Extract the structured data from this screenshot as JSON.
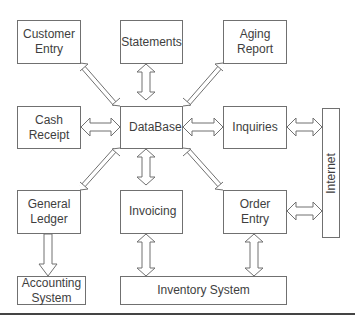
{
  "diagram": {
    "nodes": {
      "customer_entry": "Customer\nEntry",
      "statements": "Statements",
      "aging_report": "Aging\nReport",
      "cash_receipt": "Cash\nReceipt",
      "database": "DataBase",
      "inquiries": "Inquiries",
      "internet": "Internet",
      "general_ledger": "General\nLedger",
      "invoicing": "Invoicing",
      "order_entry": "Order\nEntry",
      "accounting_system": "Accounting\nSystem",
      "inventory_system": "Inventory System"
    },
    "edges": [
      {
        "from": "customer_entry",
        "to": "database",
        "type": "bidirectional"
      },
      {
        "from": "statements",
        "to": "database",
        "type": "bidirectional"
      },
      {
        "from": "aging_report",
        "to": "database",
        "type": "bidirectional"
      },
      {
        "from": "cash_receipt",
        "to": "database",
        "type": "bidirectional"
      },
      {
        "from": "inquiries",
        "to": "database",
        "type": "bidirectional"
      },
      {
        "from": "general_ledger",
        "to": "database",
        "type": "bidirectional"
      },
      {
        "from": "invoicing",
        "to": "database",
        "type": "bidirectional"
      },
      {
        "from": "order_entry",
        "to": "database",
        "type": "bidirectional"
      },
      {
        "from": "inquiries",
        "to": "internet",
        "type": "bidirectional"
      },
      {
        "from": "order_entry",
        "to": "internet",
        "type": "bidirectional"
      },
      {
        "from": "general_ledger",
        "to": "accounting_system",
        "type": "unidirectional"
      },
      {
        "from": "invoicing",
        "to": "inventory_system",
        "type": "bidirectional"
      },
      {
        "from": "order_entry",
        "to": "inventory_system",
        "type": "bidirectional"
      }
    ],
    "colors": {
      "stroke": "#707070",
      "fill": "#ffffff",
      "text": "#3e3e3e"
    }
  }
}
